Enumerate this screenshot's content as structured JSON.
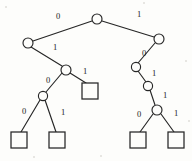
{
  "diagram": {
    "type": "binary-tree",
    "canvas": {
      "width": 192,
      "height": 161
    },
    "colors": {
      "stroke": "#262626",
      "background": "#fdfdfb",
      "label": "#1a1a1a"
    },
    "nodes": [
      {
        "id": "n-root",
        "kind": "internal",
        "cx": 97,
        "cy": 19,
        "r": 5.0
      },
      {
        "id": "n-left",
        "kind": "internal",
        "cx": 28,
        "cy": 43,
        "r": 5.0
      },
      {
        "id": "n-right",
        "kind": "internal",
        "cx": 159,
        "cy": 39,
        "r": 5.0
      },
      {
        "id": "n-l1",
        "kind": "internal",
        "cx": 66,
        "cy": 70,
        "r": 5.0
      },
      {
        "id": "n-l2",
        "kind": "internal",
        "cx": 43,
        "cy": 96,
        "r": 4.6
      },
      {
        "id": "n-r1",
        "kind": "internal",
        "cx": 136,
        "cy": 67,
        "r": 4.6
      },
      {
        "id": "n-r2",
        "kind": "internal",
        "cx": 148,
        "cy": 86,
        "r": 4.6
      },
      {
        "id": "n-r3",
        "kind": "internal",
        "cx": 157,
        "cy": 110,
        "r": 5.0
      }
    ],
    "leaves": [
      {
        "id": "leaf-a",
        "x": 82,
        "y": 83,
        "w": 16,
        "h": 16
      },
      {
        "id": "leaf-b",
        "x": 11,
        "y": 132,
        "w": 16,
        "h": 16
      },
      {
        "id": "leaf-c",
        "x": 49,
        "y": 132,
        "w": 16,
        "h": 16
      },
      {
        "id": "leaf-d",
        "x": 130,
        "y": 132,
        "w": 16,
        "h": 16
      },
      {
        "id": "leaf-e",
        "x": 168,
        "y": 132,
        "w": 16,
        "h": 16
      }
    ],
    "edges": [
      {
        "id": "e-root-left",
        "from": "n-root",
        "to": "n-left",
        "x1": 92,
        "y1": 21,
        "x2": 33,
        "y2": 41
      },
      {
        "id": "e-root-right",
        "from": "n-root",
        "to": "n-right",
        "x1": 102,
        "y1": 21,
        "x2": 154,
        "y2": 37
      },
      {
        "id": "e-left-l1",
        "from": "n-left",
        "to": "n-l1",
        "x1": 31,
        "y1": 47,
        "x2": 62,
        "y2": 66
      },
      {
        "id": "e-l1-l2",
        "from": "n-l1",
        "to": "n-l2",
        "x1": 62,
        "y1": 73,
        "x2": 46,
        "y2": 92
      },
      {
        "id": "e-l1-leafa",
        "from": "n-l1",
        "to": "leaf-a",
        "x1": 70,
        "y1": 73,
        "x2": 86,
        "y2": 83
      },
      {
        "id": "e-l2-leafb",
        "from": "n-l2",
        "to": "leaf-b",
        "x1": 40,
        "y1": 100,
        "x2": 21,
        "y2": 132
      },
      {
        "id": "e-l2-leafc",
        "from": "n-l2",
        "to": "leaf-c",
        "x1": 45,
        "y1": 100,
        "x2": 56,
        "y2": 132
      },
      {
        "id": "e-right-r1",
        "from": "n-right",
        "to": "n-r1",
        "x1": 155,
        "y1": 43,
        "x2": 138,
        "y2": 63
      },
      {
        "id": "e-r1-r2",
        "from": "n-r1",
        "to": "n-r2",
        "x1": 138,
        "y1": 71,
        "x2": 146,
        "y2": 82
      },
      {
        "id": "e-r2-r3",
        "from": "n-r2",
        "to": "n-r3",
        "x1": 150,
        "y1": 90,
        "x2": 155,
        "y2": 105
      },
      {
        "id": "e-r3-leafd",
        "from": "n-r3",
        "to": "leaf-d",
        "x1": 153,
        "y1": 114,
        "x2": 140,
        "y2": 132
      },
      {
        "id": "e-r3-leafe",
        "from": "n-r3",
        "to": "leaf-e",
        "x1": 161,
        "y1": 114,
        "x2": 174,
        "y2": 132
      }
    ],
    "edge_labels": [
      {
        "id": "lbl-root-left",
        "text": "0",
        "x": 58,
        "y": 16
      },
      {
        "id": "lbl-root-right",
        "text": "1",
        "x": 139,
        "y": 14
      },
      {
        "id": "lbl-left-l1",
        "text": "1",
        "x": 55,
        "y": 47
      },
      {
        "id": "lbl-l1-l2",
        "text": "0",
        "x": 48,
        "y": 80
      },
      {
        "id": "lbl-l1-leafa",
        "text": "1",
        "x": 85,
        "y": 71
      },
      {
        "id": "lbl-l2-leafb",
        "text": "0",
        "x": 24,
        "y": 111
      },
      {
        "id": "lbl-l2-leafc",
        "text": "1",
        "x": 63,
        "y": 112
      },
      {
        "id": "lbl-right-r1",
        "text": "0",
        "x": 144,
        "y": 53
      },
      {
        "id": "lbl-r1-r2",
        "text": "1",
        "x": 154,
        "y": 73
      },
      {
        "id": "lbl-r2-r3",
        "text": "1",
        "x": 165,
        "y": 95
      },
      {
        "id": "lbl-r3-leafd",
        "text": "0",
        "x": 139,
        "y": 114
      },
      {
        "id": "lbl-r3-leafe",
        "text": "1",
        "x": 176,
        "y": 113
      }
    ],
    "specks": [
      {
        "x": 5,
        "y": 6,
        "size": 2
      },
      {
        "x": 143,
        "y": 2,
        "size": 2
      },
      {
        "x": 185,
        "y": 60,
        "size": 2
      },
      {
        "x": 100,
        "y": 155,
        "size": 2
      },
      {
        "x": 33,
        "y": 156,
        "size": 2
      },
      {
        "x": 188,
        "y": 120,
        "size": 2
      }
    ]
  }
}
